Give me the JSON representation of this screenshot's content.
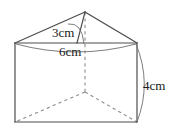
{
  "figure": {
    "name": "triangular-prism-diagram",
    "shape": "triangular prism",
    "stroke_color": "#4d4d4d",
    "dashed_color": "#8c8c8c",
    "arc_color": "#6e6e6e",
    "background_color": "#ffffff",
    "text_color": "#1a1a1a"
  },
  "labels": {
    "slant_height": "3cm",
    "base_width": "6cm",
    "prism_length": "4cm"
  },
  "geometry": {
    "apex": [
      85,
      12
    ],
    "top_left": [
      15,
      43
    ],
    "top_right": [
      137,
      43
    ],
    "bottom_left": [
      15,
      122
    ],
    "bottom_right": [
      137,
      122
    ],
    "hidden_back_vertex": [
      85,
      92
    ]
  }
}
